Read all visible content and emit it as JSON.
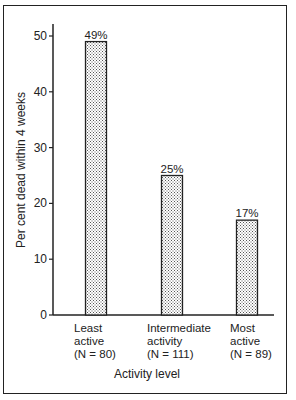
{
  "chart_data": {
    "type": "bar",
    "title": "",
    "xlabel": "Activity level",
    "ylabel": "Per cent dead within 4 weeks",
    "ylim": [
      0,
      52
    ],
    "yticks": [
      0,
      10,
      20,
      30,
      40,
      50
    ],
    "grid": false,
    "legend": null,
    "categories": [
      [
        "Least",
        "active",
        "(N = 80)"
      ],
      [
        "Intermediate",
        "activity",
        "(N = 111)"
      ],
      [
        "Most",
        "active",
        "(N = 89)"
      ]
    ],
    "values": [
      49,
      25,
      17
    ],
    "value_labels": [
      "49%",
      "25%",
      "17%"
    ],
    "bar_fill": "stippled"
  },
  "colors": {
    "ink": "#222222",
    "background": "#ffffff",
    "stipple": "#555555"
  }
}
